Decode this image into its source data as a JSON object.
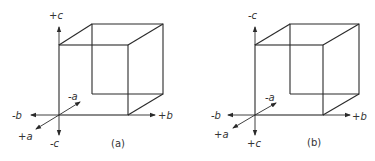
{
  "figure": {
    "panels": [
      {
        "caption": "(a)",
        "axes": {
          "up": "+c",
          "down": "-c",
          "left": "-b",
          "right": "+b",
          "front": "+a",
          "back": "-a"
        }
      },
      {
        "caption": "(b)",
        "axes": {
          "up": "-c",
          "down": "+c",
          "left": "-b",
          "right": "+b",
          "front": "+a",
          "back": "-a"
        }
      }
    ],
    "colors": {
      "line": "#2a2a2a",
      "text": "#333333",
      "background": "#ffffff"
    }
  }
}
